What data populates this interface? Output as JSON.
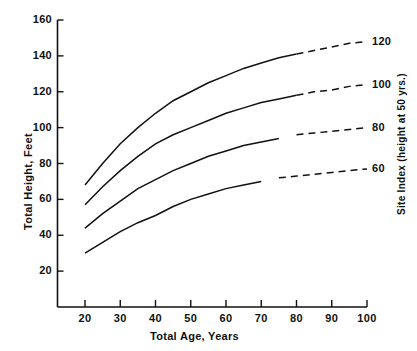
{
  "chart_data": {
    "type": "line",
    "title": "",
    "xlabel": "Total Age, Years",
    "ylabel": "Total Height, Feet",
    "right_axis_label": "Site Index (height at 50 yrs.)",
    "xlim": [
      16,
      100
    ],
    "ylim": [
      0,
      160
    ],
    "xticks": [
      20,
      30,
      40,
      50,
      60,
      70,
      80,
      90,
      100
    ],
    "yticks": [
      20,
      40,
      60,
      80,
      100,
      120,
      140,
      160
    ],
    "right_ticks": [
      60,
      80,
      100,
      120
    ],
    "grid": false,
    "legend_position": "right-axis-labels",
    "x": [
      20,
      25,
      30,
      35,
      40,
      45,
      50,
      55,
      60,
      65,
      70,
      75,
      80,
      85,
      90,
      95,
      100
    ],
    "series": [
      {
        "name": "120",
        "site_index": 120,
        "solid_until_x": 80,
        "values": [
          68,
          80,
          91,
          100,
          108,
          115,
          120,
          125,
          129,
          133,
          136,
          139,
          141,
          143,
          145,
          147,
          148
        ]
      },
      {
        "name": "100",
        "site_index": 100,
        "solid_until_x": 80,
        "values": [
          57,
          67,
          76,
          84,
          91,
          96,
          100,
          104,
          108,
          111,
          114,
          116,
          118,
          120,
          121,
          123,
          124
        ]
      },
      {
        "name": "80",
        "site_index": 80,
        "solid_until_x": 77,
        "values": [
          44,
          52,
          59,
          66,
          71,
          76,
          80,
          84,
          87,
          90,
          92,
          94,
          96,
          97,
          98,
          99,
          100
        ]
      },
      {
        "name": "60",
        "site_index": 60,
        "solid_until_x": 72,
        "values": [
          30,
          36,
          42,
          47,
          51,
          56,
          60,
          63,
          66,
          68,
          70,
          72,
          73,
          74,
          75,
          76,
          77
        ]
      }
    ]
  },
  "axes": {
    "y_title": "Total Height, Feet",
    "x_title": "Total Age, Years",
    "right_title": "Site Index (height at 50 yrs.)"
  }
}
